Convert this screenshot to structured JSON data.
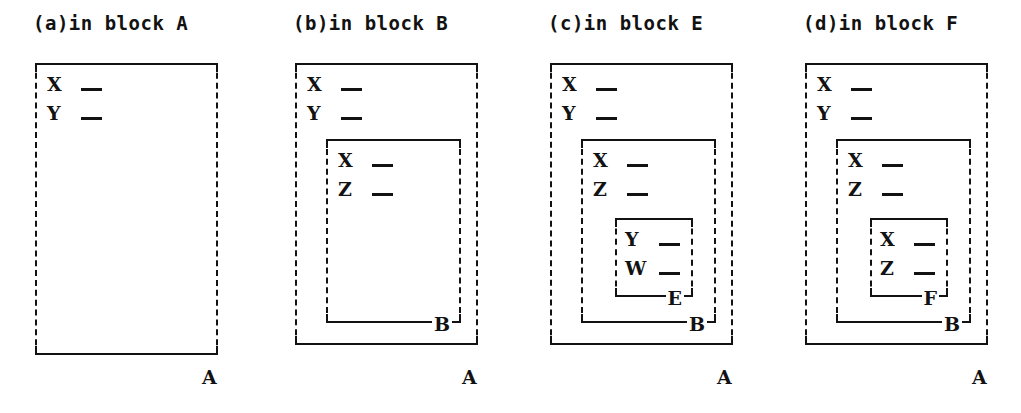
{
  "figure": {
    "kind": "nested-scope-diagram",
    "ink_color": "#121212",
    "background_color": "#ffffff"
  },
  "panels": [
    {
      "id": "a",
      "caption": "(a)in block A",
      "outer_label": "A",
      "blocks": [
        {
          "label": "A",
          "label_placement": "outside-below-right",
          "declarations": [
            {
              "name": "X",
              "value": ""
            },
            {
              "name": "Y",
              "value": ""
            }
          ]
        }
      ]
    },
    {
      "id": "b",
      "caption": "(b)in block B",
      "outer_label": "A",
      "blocks": [
        {
          "label": "A",
          "label_placement": "outside-below-right",
          "declarations": [
            {
              "name": "X",
              "value": ""
            },
            {
              "name": "Y",
              "value": ""
            }
          ]
        },
        {
          "label": "B",
          "label_placement": "on-bottom-edge-right",
          "declarations": [
            {
              "name": "X",
              "value": ""
            },
            {
              "name": "Z",
              "value": ""
            }
          ]
        }
      ]
    },
    {
      "id": "c",
      "caption": "(c)in block E",
      "outer_label": "A",
      "blocks": [
        {
          "label": "A",
          "label_placement": "outside-below-right",
          "declarations": [
            {
              "name": "X",
              "value": ""
            },
            {
              "name": "Y",
              "value": ""
            }
          ]
        },
        {
          "label": "B",
          "label_placement": "on-bottom-edge-right",
          "declarations": [
            {
              "name": "X",
              "value": ""
            },
            {
              "name": "Z",
              "value": ""
            }
          ]
        },
        {
          "label": "E",
          "label_placement": "on-bottom-edge-right",
          "declarations": [
            {
              "name": "Y",
              "value": ""
            },
            {
              "name": "W",
              "value": ""
            }
          ]
        }
      ]
    },
    {
      "id": "d",
      "caption": "(d)in block F",
      "outer_label": "A",
      "blocks": [
        {
          "label": "A",
          "label_placement": "outside-below-right",
          "declarations": [
            {
              "name": "X",
              "value": ""
            },
            {
              "name": "Y",
              "value": ""
            }
          ]
        },
        {
          "label": "B",
          "label_placement": "on-bottom-edge-right",
          "declarations": [
            {
              "name": "X",
              "value": ""
            },
            {
              "name": "Z",
              "value": ""
            }
          ]
        },
        {
          "label": "F",
          "label_placement": "on-bottom-edge-right",
          "declarations": [
            {
              "name": "X",
              "value": ""
            },
            {
              "name": "Z",
              "value": ""
            }
          ]
        }
      ]
    }
  ]
}
